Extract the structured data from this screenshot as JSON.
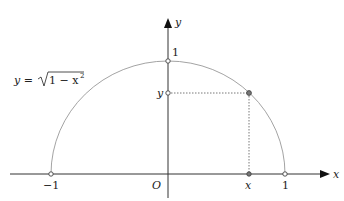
{
  "diagram": {
    "type": "unit-semicircle-plot",
    "axes": {
      "x_label": "x",
      "y_label": "y",
      "origin_label": "O"
    },
    "curve_label": {
      "lhs": "y = ",
      "radicand": "1 − x",
      "exponent": "2"
    },
    "tick_labels": {
      "x_neg_one": "−1",
      "x_one": "1",
      "x_point": "x",
      "y_one": "1",
      "y_point": "y"
    },
    "colors": {
      "axis": "#333333",
      "curve": "#999999",
      "dotted": "#555555",
      "point_fill": "#777777"
    }
  }
}
